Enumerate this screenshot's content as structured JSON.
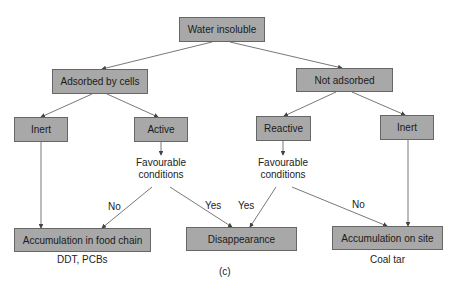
{
  "diagram": {
    "root": "Water insoluble",
    "level1": {
      "left": "Adsorbed by cells",
      "right": "Not adsorbed"
    },
    "level2": {
      "inert_left": "Inert",
      "active": "Active",
      "reactive": "Reactive",
      "inert_right": "Inert"
    },
    "conditions": {
      "left_line1": "Favourable",
      "left_line2": "conditions",
      "right_line1": "Favourable",
      "right_line2": "conditions"
    },
    "edges": {
      "left_no": "No",
      "left_yes": "Yes",
      "right_yes": "Yes",
      "right_no": "No"
    },
    "outcomes": {
      "food_chain": "Accumulation in food chain",
      "disappearance": "Disappearance",
      "on_site": "Accumulation on site"
    },
    "examples": {
      "food_chain": "DDT, PCBs",
      "on_site": "Coal tar"
    },
    "caption": "(c)",
    "colors": {
      "box_fill": "#a8a8a8",
      "box_border": "#666666",
      "line": "#555555"
    }
  }
}
